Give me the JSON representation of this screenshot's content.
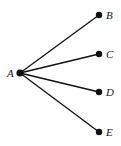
{
  "diagram": {
    "type": "tree",
    "root": "A",
    "nodes": [
      {
        "id": "A",
        "label": "A",
        "x": 20,
        "y": 73,
        "label_dx": -13,
        "label_dy": 4
      },
      {
        "id": "B",
        "label": "B",
        "x": 99,
        "y": 15,
        "label_dx": 7,
        "label_dy": 4
      },
      {
        "id": "C",
        "label": "C",
        "x": 99,
        "y": 54,
        "label_dx": 7,
        "label_dy": 4
      },
      {
        "id": "D",
        "label": "D",
        "x": 99,
        "y": 92,
        "label_dx": 7,
        "label_dy": 4
      },
      {
        "id": "E",
        "label": "E",
        "x": 99,
        "y": 132,
        "label_dx": 7,
        "label_dy": 4
      }
    ],
    "edges": [
      {
        "from": "A",
        "to": "B"
      },
      {
        "from": "A",
        "to": "C"
      },
      {
        "from": "A",
        "to": "D"
      },
      {
        "from": "A",
        "to": "E"
      }
    ],
    "colors": {
      "line": "#111111",
      "node": "#111111",
      "background": "#ffffff"
    }
  }
}
